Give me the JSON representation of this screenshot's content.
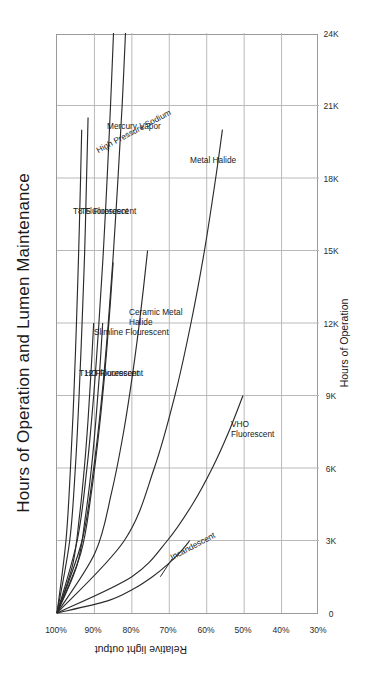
{
  "chart_data": {
    "type": "line",
    "title": "Hours of Operation and Lumen Maintenance",
    "xlabel": "Hours of Operation",
    "ylabel": "Relative light output",
    "xlim": [
      0,
      24000
    ],
    "ylim": [
      30,
      100
    ],
    "y_inverted": true,
    "grid": true,
    "legend": "inline-labels",
    "orientation": "rotated-90-ccw",
    "xticks": [
      0,
      3000,
      6000,
      9000,
      12000,
      15000,
      18000,
      21000,
      24000
    ],
    "xticklabels": [
      "0",
      "3K",
      "6K",
      "9K",
      "12K",
      "15K",
      "18K",
      "21K",
      "24K"
    ],
    "yticks": [
      100,
      90,
      80,
      70,
      60,
      50,
      40,
      30
    ],
    "yticklabels": [
      "100%",
      "90%",
      "80%",
      "70%",
      "60%",
      "50%",
      "40%",
      "30%"
    ],
    "series": [
      {
        "name": "T8 Fluorescent",
        "label": "T8 Fluorescent",
        "x": [
          0,
          3000,
          6000,
          9000,
          12000,
          15000,
          18000,
          20000
        ],
        "y": [
          100,
          97.6,
          96.4,
          95.5,
          94.8,
          94.2,
          93.7,
          93.4
        ]
      },
      {
        "name": "T5 Fluorescent",
        "label": "T5 Fluorescent",
        "x": [
          0,
          3000,
          6000,
          9000,
          12000,
          15000,
          18000,
          20500
        ],
        "y": [
          100,
          96.6,
          95.1,
          94.1,
          93.3,
          92.6,
          92.1,
          91.7
        ]
      },
      {
        "name": "High Pressure Sodium",
        "label": "High Pressure Sodium",
        "x": [
          0,
          3000,
          6000,
          9000,
          12000,
          15000,
          18000,
          21000,
          24000
        ],
        "y": [
          100,
          94.6,
          92.0,
          90.2,
          88.8,
          87.6,
          86.6,
          85.7,
          84.9
        ]
      },
      {
        "name": "Mercury Vapor",
        "label": "Mercury Vapor",
        "x": [
          0,
          3000,
          6000,
          9000,
          12000,
          15000,
          18000,
          21000,
          24000
        ],
        "y": [
          100,
          93.3,
          90.2,
          88.0,
          86.3,
          84.9,
          83.7,
          82.6,
          81.7
        ]
      },
      {
        "name": "T12 Flourescent",
        "label": "T12 Flourescent",
        "x": [
          0,
          2000,
          4000,
          6000,
          8000,
          10000,
          12000
        ],
        "y": [
          100,
          95.8,
          94.0,
          92.7,
          91.7,
          90.9,
          90.2
        ]
      },
      {
        "name": "HO Flourescent",
        "label": "HO Flourescent",
        "x": [
          0,
          2000,
          4000,
          6000,
          8000,
          10000,
          12000
        ],
        "y": [
          100,
          94.6,
          92.4,
          90.8,
          89.6,
          88.6,
          87.8
        ]
      },
      {
        "name": "Slimline Flourescent",
        "label": "Slimline Flourescent",
        "x": [
          0,
          2500,
          5000,
          7500,
          10000,
          12500,
          14500
        ],
        "y": [
          100,
          93.6,
          90.8,
          88.8,
          87.2,
          85.9,
          85.0
        ]
      },
      {
        "name": "Ceramic Metal Halide",
        "label": "Ceramic Metal Halide",
        "x": [
          0,
          2500,
          5000,
          7500,
          10000,
          12500,
          15000
        ],
        "y": [
          100,
          89.8,
          85.4,
          82.2,
          79.7,
          77.6,
          75.8
        ]
      },
      {
        "name": "Metal Halide",
        "label": "Metal Halide",
        "x": [
          0,
          3000,
          6000,
          9000,
          12000,
          15000,
          18000,
          20000
        ],
        "y": [
          100,
          82.0,
          74.0,
          68.5,
          64.2,
          60.6,
          57.6,
          55.8
        ]
      },
      {
        "name": "VHO Fluorescent",
        "label": "VHO Fluorescent",
        "x": [
          0,
          1500,
          3000,
          4500,
          6000,
          7500,
          9000
        ],
        "y": [
          100,
          80.0,
          70.5,
          63.8,
          58.5,
          54.1,
          50.3
        ]
      },
      {
        "name": "Incandescent",
        "label": "Incandescent",
        "x": [
          0,
          500,
          1000,
          1500,
          2000,
          2500,
          3000
        ],
        "y": [
          100,
          86.5,
          79.5,
          74.5,
          70.5,
          67.2,
          64.5
        ]
      }
    ]
  }
}
